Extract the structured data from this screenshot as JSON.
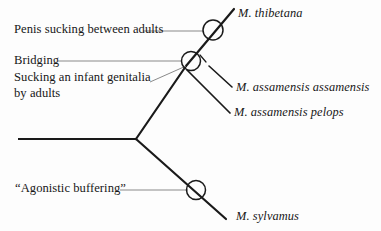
{
  "figure": {
    "kind": "phylogenetic-tree",
    "background_color": "#fdfdfd",
    "line_color": "#1a1a1a",
    "leader_color": "#8a8a8a"
  },
  "taxa": [
    {
      "id": "thibetana",
      "label": "M. thibetana"
    },
    {
      "id": "assamensis-assamensis",
      "label": "M. assamensis assamensis"
    },
    {
      "id": "assamensis-pelops",
      "label": "M. assamensis pelops"
    },
    {
      "id": "sylvanus",
      "label": "M. sylvamus"
    }
  ],
  "traits": [
    {
      "id": "penis-sucking",
      "label": "Penis sucking between adults"
    },
    {
      "id": "bridging",
      "label": "Bridging"
    },
    {
      "id": "sucking-infant-line1",
      "label": "Sucking an infant genitalia"
    },
    {
      "id": "sucking-infant-line2",
      "label": "by adults"
    },
    {
      "id": "agonistic-buffering",
      "label": "“Agonistic buffering”"
    }
  ],
  "nodes": [
    {
      "id": "trait-marker-1",
      "trait": "penis-sucking",
      "cx": 213,
      "cy": 30,
      "r": 10
    },
    {
      "id": "trait-marker-2",
      "trait": "bridging",
      "cx": 191,
      "cy": 61,
      "r": 9.5
    },
    {
      "id": "trait-marker-3",
      "trait": "agonistic-buffering",
      "cx": 196,
      "cy": 190,
      "r": 9.5
    }
  ]
}
